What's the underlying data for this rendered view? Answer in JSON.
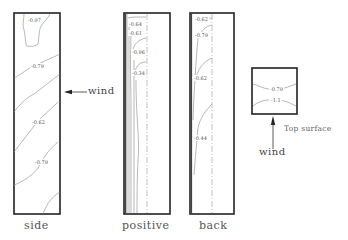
{
  "panels": [
    {
      "name": "side",
      "title": "side",
      "contour_labels": [
        "-0.97",
        "-0.79",
        "-0.62",
        "-0.79"
      ]
    },
    {
      "name": "positive",
      "title": "positive",
      "contour_labels": [
        "-0.64",
        "-0.61",
        "-0.96",
        "-0.34"
      ]
    },
    {
      "name": "back",
      "title": "back",
      "contour_labels": [
        "-0.62",
        "-0.79",
        "-0.62",
        "-0.44"
      ]
    },
    {
      "name": "top",
      "title": "Top surface",
      "contour_labels": [
        "-0.79",
        "-1.1"
      ]
    }
  ],
  "annotations": {
    "side_wind": "wind",
    "top_wind": "wind"
  },
  "colors": {
    "frame": "#222222",
    "contour": "#888888",
    "dashed_axis": "#999999",
    "text": "#444444"
  }
}
